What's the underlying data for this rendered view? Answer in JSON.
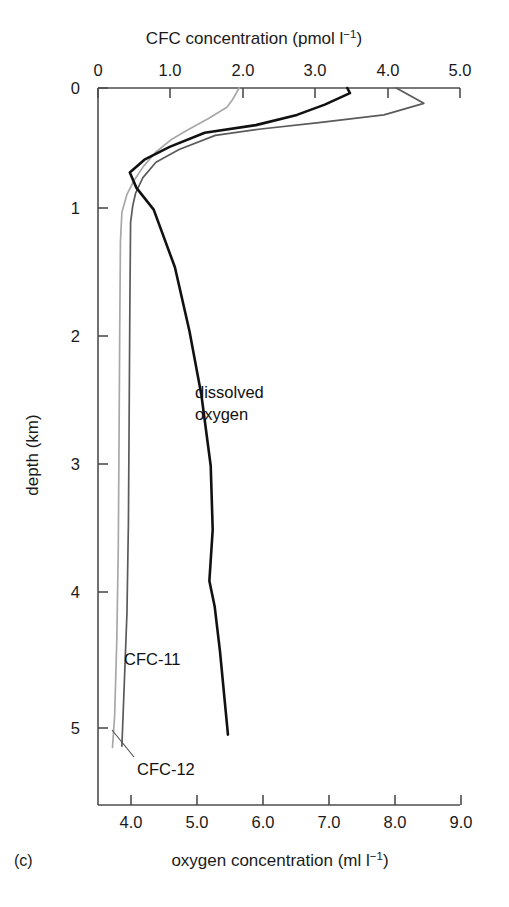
{
  "panel": {
    "label": "(c)"
  },
  "axes": {
    "top": {
      "title_main": "CFC concentration (pmol l",
      "title_sup": "−1",
      "title_close": ")",
      "title_full": "CFC concentration (pmol l−1)",
      "ticks": [
        "0",
        "1.0",
        "2.0",
        "3.0",
        "4.0",
        "5.0"
      ],
      "tick_values": [
        0,
        1.0,
        2.0,
        3.0,
        4.0,
        5.0
      ],
      "range": [
        0,
        5.0
      ]
    },
    "bottom": {
      "title_main": "oxygen concentration (ml l",
      "title_sup": "−1",
      "title_close": ")",
      "title_full": "oxygen concentration (ml l−1)",
      "ticks": [
        "4.0",
        "5.0",
        "6.0",
        "7.0",
        "8.0",
        "9.0"
      ],
      "tick_values": [
        4.0,
        5.0,
        6.0,
        7.0,
        8.0,
        9.0
      ],
      "range": [
        3.54,
        9.0
      ]
    },
    "left": {
      "title": "depth (km)",
      "ticks": [
        "0",
        "1",
        "2",
        "3",
        "4",
        "5"
      ],
      "tick_values": [
        0,
        1,
        2,
        3,
        4,
        5
      ],
      "range": [
        0,
        5.6
      ]
    }
  },
  "annotations": [
    {
      "name": "dissolved-oxygen",
      "line1": "dissolved",
      "line2": "oxygen"
    },
    {
      "name": "cfc-11",
      "text": "CFC-11"
    },
    {
      "name": "cfc-12",
      "text": "CFC-12"
    }
  ],
  "colors": {
    "cfc11": "#5a5a5a",
    "cfc12": "#a8a8a8",
    "oxygen": "#111111",
    "axis": "#4d4d4d",
    "background": "#ffffff"
  },
  "chart_data": {
    "type": "line",
    "title": "CFC concentration (pmol l−1)",
    "xlabel": "CFC concentration (pmol l−1)",
    "xlabel_secondary": "oxygen concentration (ml l−1)",
    "ylabel": "depth (km)",
    "ylim": [
      5.6,
      0
    ],
    "y_inverted": true,
    "xlim_top": [
      0,
      5.0
    ],
    "xlim_bottom": [
      3.54,
      9.0
    ],
    "grid": false,
    "legend": "inline-annotations",
    "series": [
      {
        "name": "CFC-12",
        "axis": "top",
        "color": "#a8a8a8",
        "points": [
          {
            "x": 1.95,
            "depth": 0.0
          },
          {
            "x": 1.86,
            "depth": 0.09
          },
          {
            "x": 1.78,
            "depth": 0.15
          },
          {
            "x": 1.52,
            "depth": 0.24
          },
          {
            "x": 1.23,
            "depth": 0.33
          },
          {
            "x": 1.02,
            "depth": 0.4
          },
          {
            "x": 0.8,
            "depth": 0.5
          },
          {
            "x": 0.63,
            "depth": 0.61
          },
          {
            "x": 0.5,
            "depth": 0.72
          },
          {
            "x": 0.4,
            "depth": 0.83
          },
          {
            "x": 0.33,
            "depth": 0.97
          },
          {
            "x": 0.31,
            "depth": 1.2
          },
          {
            "x": 0.3,
            "depth": 1.9
          },
          {
            "x": 0.29,
            "depth": 2.8
          },
          {
            "x": 0.28,
            "depth": 3.6
          },
          {
            "x": 0.26,
            "depth": 4.3
          },
          {
            "x": 0.23,
            "depth": 4.9
          },
          {
            "x": 0.2,
            "depth": 5.15
          }
        ]
      },
      {
        "name": "CFC-11",
        "axis": "top",
        "color": "#5a5a5a",
        "points": [
          {
            "x": 4.12,
            "depth": 0.0
          },
          {
            "x": 4.5,
            "depth": 0.12
          },
          {
            "x": 3.95,
            "depth": 0.21
          },
          {
            "x": 3.05,
            "depth": 0.27
          },
          {
            "x": 2.25,
            "depth": 0.32
          },
          {
            "x": 1.62,
            "depth": 0.37
          },
          {
            "x": 1.12,
            "depth": 0.48
          },
          {
            "x": 0.8,
            "depth": 0.58
          },
          {
            "x": 0.62,
            "depth": 0.7
          },
          {
            "x": 0.52,
            "depth": 0.82
          },
          {
            "x": 0.48,
            "depth": 0.92
          },
          {
            "x": 0.45,
            "depth": 1.05
          },
          {
            "x": 0.44,
            "depth": 1.7
          },
          {
            "x": 0.43,
            "depth": 2.6
          },
          {
            "x": 0.42,
            "depth": 3.4
          },
          {
            "x": 0.4,
            "depth": 4.1
          },
          {
            "x": 0.36,
            "depth": 4.7
          },
          {
            "x": 0.33,
            "depth": 5.14
          }
        ]
      },
      {
        "name": "dissolved oxygen",
        "axis": "bottom",
        "color": "#111111",
        "points": [
          {
            "x": 7.3,
            "depth": 0.0
          },
          {
            "x": 7.34,
            "depth": 0.04
          },
          {
            "x": 6.96,
            "depth": 0.13
          },
          {
            "x": 6.54,
            "depth": 0.21
          },
          {
            "x": 5.92,
            "depth": 0.29
          },
          {
            "x": 5.15,
            "depth": 0.35
          },
          {
            "x": 4.62,
            "depth": 0.46
          },
          {
            "x": 4.24,
            "depth": 0.56
          },
          {
            "x": 4.02,
            "depth": 0.66
          },
          {
            "x": 4.12,
            "depth": 0.78
          },
          {
            "x": 4.38,
            "depth": 0.95
          },
          {
            "x": 4.7,
            "depth": 1.4
          },
          {
            "x": 4.92,
            "depth": 1.9
          },
          {
            "x": 5.1,
            "depth": 2.4
          },
          {
            "x": 5.24,
            "depth": 2.95
          },
          {
            "x": 5.27,
            "depth": 3.45
          },
          {
            "x": 5.22,
            "depth": 3.85
          },
          {
            "x": 5.3,
            "depth": 4.05
          },
          {
            "x": 5.38,
            "depth": 4.4
          },
          {
            "x": 5.5,
            "depth": 5.05
          }
        ]
      }
    ]
  }
}
